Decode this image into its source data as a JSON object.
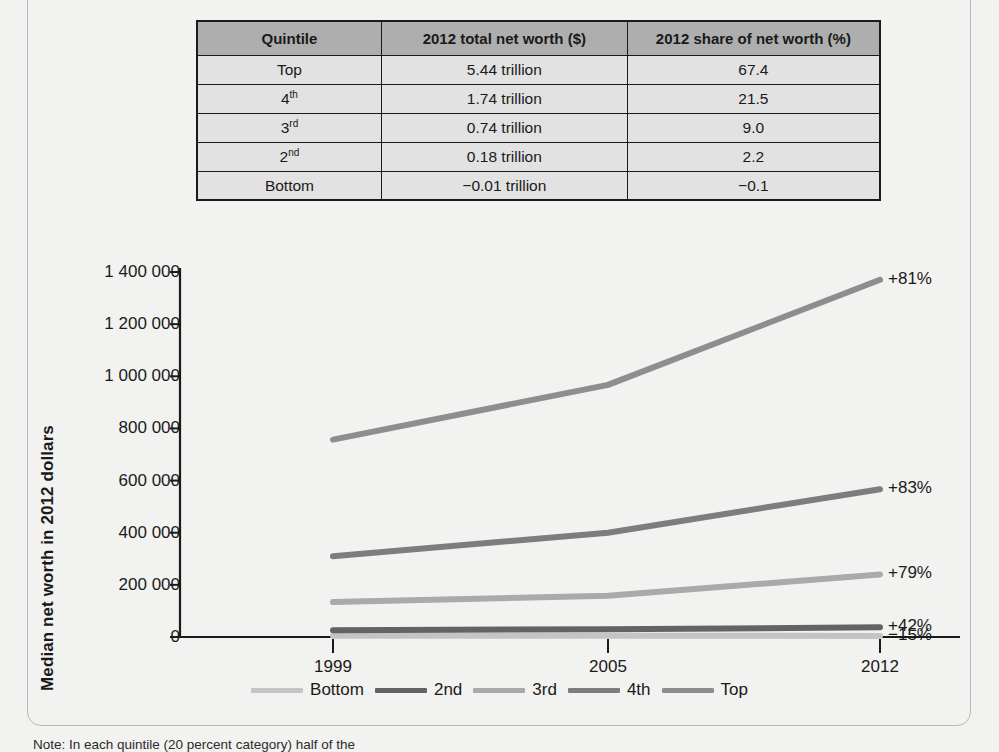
{
  "table": {
    "headers": [
      "Quintile",
      "2012 total net worth ($)",
      "2012 share of net worth (%)"
    ],
    "rows": [
      {
        "quintile": "Top",
        "quintile_sup": "",
        "net_worth": "5.44 trillion",
        "share": "67.4"
      },
      {
        "quintile": "4",
        "quintile_sup": "th",
        "net_worth": "1.74 trillion",
        "share": "21.5"
      },
      {
        "quintile": "3",
        "quintile_sup": "rd",
        "net_worth": "0.74 trillion",
        "share": "9.0"
      },
      {
        "quintile": "2",
        "quintile_sup": "nd",
        "net_worth": "0.18 trillion",
        "share": "2.2"
      },
      {
        "quintile": "Bottom",
        "quintile_sup": "",
        "net_worth": "−0.01 trillion",
        "share": "−0.1"
      }
    ]
  },
  "note": "Note: In each quintile (20 percent category) half of the",
  "chart_data": {
    "type": "line",
    "title": "",
    "xlabel": "",
    "ylabel": "Median net worth in 2012 dollars",
    "x": [
      "1999",
      "2005",
      "2012"
    ],
    "xtick_labels": [
      "1999",
      "2005",
      "2012"
    ],
    "ytick_labels": [
      "0",
      "200 000",
      "400 000",
      "600 000",
      "800 000",
      "1 000 000",
      "1 200 000",
      "1 400 000"
    ],
    "yticks": [
      0,
      200000,
      400000,
      600000,
      800000,
      1000000,
      1200000,
      1400000
    ],
    "ylim": [
      0,
      1400000
    ],
    "grid": false,
    "legend_position": "bottom",
    "series": [
      {
        "name": "Bottom",
        "values": [
          5000,
          5000,
          4000
        ],
        "change": "−15%",
        "color": "#c4c4c4"
      },
      {
        "name": "2nd",
        "values": [
          26000,
          30000,
          37000
        ],
        "change": "+42%",
        "color": "#636363"
      },
      {
        "name": "3rd",
        "values": [
          134000,
          158000,
          240000
        ],
        "change": "+79%",
        "color": "#aaaaaa"
      },
      {
        "name": "4th",
        "values": [
          310000,
          400000,
          567000
        ],
        "change": "+83%",
        "color": "#7d7d7d"
      },
      {
        "name": "Top",
        "values": [
          757000,
          967000,
          1370000
        ],
        "change": "+81%",
        "color": "#8e8e8e"
      }
    ]
  }
}
